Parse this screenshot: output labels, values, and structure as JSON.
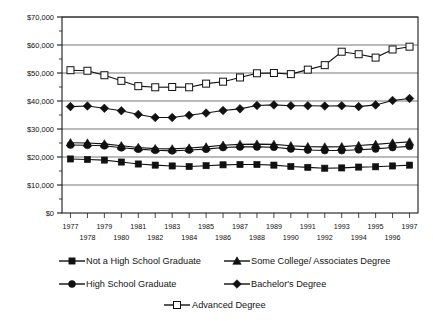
{
  "chart_data": {
    "type": "line",
    "title": "",
    "subtitle": "",
    "xlabel": "",
    "ylabel": "",
    "grid": true,
    "legend_position": "bottom",
    "x": [
      1977,
      1978,
      1979,
      1980,
      1981,
      1982,
      1983,
      1984,
      1985,
      1986,
      1987,
      1988,
      1989,
      1990,
      1991,
      1992,
      1993,
      1994,
      1995,
      1996,
      1997
    ],
    "categories": [
      "1977",
      "1978",
      "1979",
      "1980",
      "1981",
      "1982",
      "1983",
      "1984",
      "1985",
      "1986",
      "1987",
      "1988",
      "1989",
      "1990",
      "1991",
      "1992",
      "1993",
      "1994",
      "1995",
      "1996",
      "1997"
    ],
    "xtick_labels_top": [
      "1977",
      "1979",
      "1981",
      "1983",
      "1985",
      "1987",
      "1989",
      "1991",
      "1993",
      "1995",
      "1997"
    ],
    "xtick_labels_bottom": [
      "1978",
      "1980",
      "1982",
      "1984",
      "1986",
      "1988",
      "1990",
      "1992",
      "1994",
      "1996"
    ],
    "ytick_labels": [
      "$70,000",
      "$60,000",
      "$50,000",
      "$40,000",
      "$30,000",
      "$20,000",
      "$10,000",
      "$0"
    ],
    "ytick_values": [
      70000,
      60000,
      50000,
      40000,
      30000,
      20000,
      10000,
      0
    ],
    "ylim": [
      0,
      70000
    ],
    "xlim": [
      1977,
      1997
    ],
    "series": [
      {
        "name": "Not a High School Graduate",
        "marker": "filled-square",
        "color": "#111111",
        "values": [
          19300,
          19100,
          18900,
          18200,
          17500,
          17100,
          16800,
          16600,
          16900,
          17200,
          17300,
          17300,
          17100,
          16600,
          16300,
          16000,
          16100,
          16400,
          16500,
          16800,
          17100
        ]
      },
      {
        "name": "High School Graduate",
        "marker": "filled-circle",
        "color": "#111111",
        "values": [
          24300,
          24200,
          24000,
          23300,
          22800,
          22400,
          22200,
          22500,
          22800,
          23400,
          23600,
          23600,
          23500,
          22900,
          22500,
          22300,
          22300,
          22600,
          22900,
          23400,
          23800
        ]
      },
      {
        "name": "Some College/ Associates Degree",
        "marker": "filled-triangle",
        "color": "#111111",
        "values": [
          25100,
          25000,
          24700,
          24000,
          23400,
          23000,
          22900,
          23200,
          23600,
          24200,
          24500,
          24600,
          24500,
          24000,
          23700,
          23600,
          23700,
          24100,
          24500,
          25000,
          25400
        ]
      },
      {
        "name": "Bachelor's Degree",
        "marker": "filled-diamond",
        "color": "#111111",
        "values": [
          38000,
          38200,
          37400,
          36500,
          35200,
          34100,
          34100,
          34900,
          35700,
          36600,
          37200,
          38400,
          38600,
          38300,
          38300,
          38200,
          38300,
          38000,
          38600,
          40200,
          40900
        ]
      },
      {
        "name": "Advanced Degree",
        "marker": "open-square",
        "color": "#111111",
        "values": [
          51000,
          50800,
          49200,
          47200,
          45300,
          44900,
          45000,
          44900,
          46200,
          46900,
          48400,
          49900,
          50000,
          49600,
          51200,
          52800,
          57600,
          56700,
          55500,
          58400,
          59400
        ]
      }
    ]
  },
  "legend": {
    "items": [
      {
        "label": "Not a High School Graduate",
        "marker": "filled-square"
      },
      {
        "label": "Some College/ Associates Degree",
        "marker": "filled-triangle"
      },
      {
        "label": "High School Graduate",
        "marker": "filled-circle"
      },
      {
        "label": "Bachelor's Degree",
        "marker": "filled-diamond"
      },
      {
        "label": "Advanced Degree",
        "marker": "open-square"
      }
    ]
  }
}
